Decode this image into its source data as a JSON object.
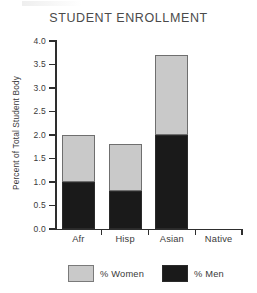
{
  "chart_data": {
    "type": "bar",
    "subtype": "stacked-bar",
    "title": "STUDENT ENROLLMENT",
    "xlabel": "",
    "ylabel": "Percent of Total Student Body",
    "categories": [
      "Afr",
      "Hisp",
      "Asian",
      "Native"
    ],
    "series": [
      {
        "name": "% Men",
        "values": [
          1.0,
          0.8,
          2.0,
          0.0
        ],
        "color": "#1a1a1a"
      },
      {
        "name": "% Women",
        "values": [
          1.0,
          1.0,
          1.7,
          0.0
        ],
        "color": "#c9c9c9"
      }
    ],
    "totals": [
      2.0,
      1.8,
      3.7,
      0.0
    ],
    "ylim": [
      0.0,
      4.0
    ],
    "ytick_labels": [
      "0.0",
      "0.5",
      "1.0",
      "1.5",
      "2.0",
      "2.5",
      "3.0",
      "3.5",
      "4.0"
    ],
    "ytick_values": [
      0.0,
      0.5,
      1.0,
      1.5,
      2.0,
      2.5,
      3.0,
      3.5,
      4.0
    ],
    "grid": false,
    "legend": {
      "position": "bottom",
      "entries": [
        {
          "label": "% Women",
          "color": "#c9c9c9"
        },
        {
          "label": "% Men",
          "color": "#1a1a1a"
        }
      ]
    }
  },
  "colors": {
    "women": "#c9c9c9",
    "men": "#1a1a1a",
    "axis": "#2e2e2e",
    "text": "#3a3a3a",
    "background": "#ffffff"
  }
}
